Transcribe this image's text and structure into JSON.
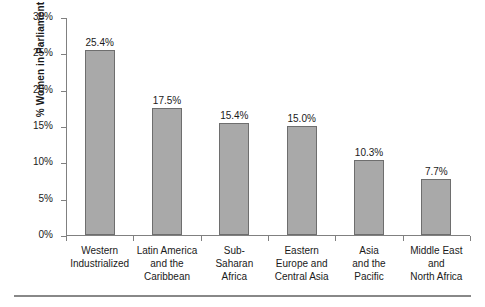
{
  "chart_data": {
    "type": "bar",
    "title": "",
    "xlabel": "",
    "ylabel": "% Women in Parliament",
    "ylim": [
      0,
      30
    ],
    "ytick_values": [
      0,
      5,
      10,
      15,
      20,
      25,
      30
    ],
    "ytick_labels": [
      "0%",
      "5%",
      "10%",
      "15%",
      "20%",
      "25%",
      "30%"
    ],
    "grid": false,
    "legend": "none",
    "bar_color": "#a9a9a9",
    "bar_edge_color": "#6e6e6e",
    "axis_color": "#808080",
    "categories": [
      "Western Industrialized",
      "Latin America and the Caribbean",
      "Sub-Saharan Africa",
      "Eastern Europe and Central Asia",
      "Asia and the Pacific",
      "Middle East and North Africa"
    ],
    "category_lines": [
      [
        "Western",
        "Industrialized"
      ],
      [
        "Latin America",
        "and the",
        "Caribbean"
      ],
      [
        "Sub-",
        "Saharan",
        "Africa"
      ],
      [
        "Eastern",
        "Europe and",
        "Central Asia"
      ],
      [
        "Asia",
        "and the",
        "Pacific"
      ],
      [
        "Middle East",
        "and",
        "North Africa"
      ]
    ],
    "values": [
      25.4,
      17.5,
      15.4,
      15.0,
      10.3,
      7.7
    ],
    "data_labels": [
      "25.4%",
      "17.5%",
      "15.4%",
      "15.0%",
      "10.3%",
      "7.7%"
    ]
  }
}
